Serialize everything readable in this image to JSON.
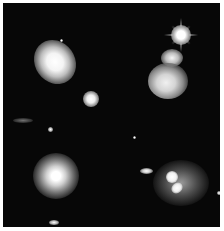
{
  "image": {
    "description": "Black-and-white astronomical photo montage of galaxies in four quadrants",
    "background_color": "#070707",
    "border_color": "#ffffff",
    "objects": [
      {
        "name": "spiral-galaxy-top-left"
      },
      {
        "name": "compact-galaxy-center"
      },
      {
        "name": "bright-star-top-right"
      },
      {
        "name": "interacting-galaxy-top-right"
      },
      {
        "name": "elliptical-galaxy-bottom-left"
      },
      {
        "name": "small-galaxy-mid-bottom"
      },
      {
        "name": "interacting-galaxy-bottom-right"
      }
    ]
  }
}
